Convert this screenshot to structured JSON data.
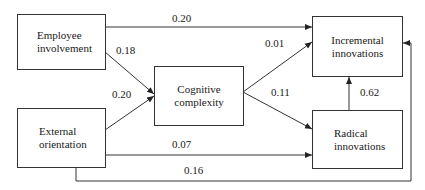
{
  "diagram": {
    "type": "path-model",
    "nodes": [
      {
        "id": "employee_involvement",
        "label_lines": [
          "Employee",
          "involvement"
        ]
      },
      {
        "id": "external_orientation",
        "label_lines": [
          "External",
          "orientation"
        ]
      },
      {
        "id": "cognitive_complexity",
        "label_lines": [
          "Cognitive",
          "complexity"
        ]
      },
      {
        "id": "incremental_innovations",
        "label_lines": [
          "Incremental",
          "innovations"
        ]
      },
      {
        "id": "radical_innovations",
        "label_lines": [
          "Radical",
          "innovations"
        ]
      }
    ],
    "edges": [
      {
        "from": "employee_involvement",
        "to": "incremental_innovations",
        "label": "0.20"
      },
      {
        "from": "employee_involvement",
        "to": "cognitive_complexity",
        "label": "0.18"
      },
      {
        "from": "external_orientation",
        "to": "cognitive_complexity",
        "label": "0.20"
      },
      {
        "from": "cognitive_complexity",
        "to": "incremental_innovations",
        "label": "0.01"
      },
      {
        "from": "cognitive_complexity",
        "to": "radical_innovations",
        "label": "0.11"
      },
      {
        "from": "radical_innovations",
        "to": "incremental_innovations",
        "label": "0.62"
      },
      {
        "from": "external_orientation",
        "to": "radical_innovations",
        "label": "0.07"
      },
      {
        "from": "external_orientation",
        "to": "incremental_innovations",
        "label": "0.16"
      }
    ],
    "style": {
      "line_color": "#333333",
      "box_border": "#333333",
      "background": "#ffffff"
    }
  }
}
